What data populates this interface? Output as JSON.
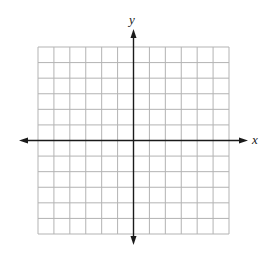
{
  "diagram": {
    "type": "coordinate-plane",
    "x_axis_label": "x",
    "y_axis_label": "y",
    "grid": {
      "columns": 12,
      "rows": 12,
      "left": 38,
      "top": 47,
      "right": 229,
      "bottom": 234,
      "line_color": "#b3b3b3"
    },
    "axes": {
      "color": "#1a1a1a",
      "x_axis_y": 140.5,
      "y_axis_x": 133.5,
      "x_arrow_left": 19,
      "x_arrow_right": 248,
      "y_arrow_top": 29,
      "y_arrow_bottom": 245
    }
  }
}
